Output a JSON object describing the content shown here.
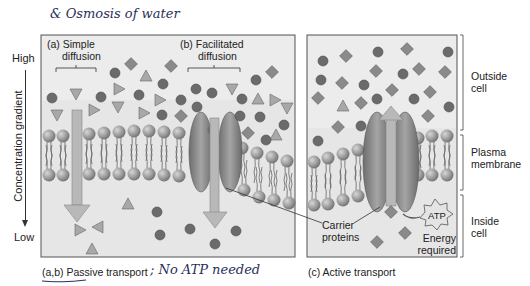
{
  "annotation_top": "& Osmosis of water",
  "annotation_bottom": "; No ATP needed",
  "gradient_axis": {
    "title": "Concentration gradient",
    "high_label": "High",
    "low_label": "Low"
  },
  "panels": {
    "passive": {
      "caption": "(a,b) Passive transport",
      "simple": {
        "line1": "(a) Simple",
        "line2": "diffusion"
      },
      "facilitated": {
        "line1": "(b) Facilitated",
        "line2": "diffusion"
      }
    },
    "active": {
      "caption": "(c) Active transport",
      "atp_label": "ATP",
      "energy_line1": "Energy",
      "energy_line2": "required"
    }
  },
  "carrier_label": {
    "line1": "Carrier",
    "line2": "proteins"
  },
  "regions": {
    "outside": {
      "line1": "Outside",
      "line2": "cell"
    },
    "membrane": {
      "line1": "Plasma",
      "line2": "membrane"
    },
    "inside": {
      "line1": "Inside",
      "line2": "cell"
    }
  },
  "colors": {
    "background": "#e6e6e6",
    "molecule_dark": "#6b6b6b",
    "molecule_light": "#a9a9a9",
    "arrow": "#b4b4b4",
    "ink": "#2a2f5a"
  }
}
